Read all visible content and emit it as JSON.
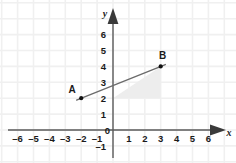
{
  "chart_data": {
    "type": "scatter",
    "title": "",
    "xlabel": "x",
    "ylabel": "y",
    "xlim": [
      -7.1,
      7.3
    ],
    "ylim": [
      -2.0,
      6.6
    ],
    "grid": true,
    "grid_spacing": 1,
    "legend": "none",
    "x_ticks": [
      -6,
      -5,
      -4,
      -3,
      -2,
      -1,
      0,
      1,
      2,
      3,
      4,
      5,
      6
    ],
    "x_tick_labels": [
      "–6",
      "–5",
      "–4",
      "–3",
      "–2",
      "–1",
      "0",
      "1",
      "2",
      "3",
      "4",
      "5",
      "6"
    ],
    "y_ticks": [
      -1,
      0,
      1,
      2,
      3,
      4,
      5,
      6
    ],
    "y_tick_labels": [
      "–1",
      "0",
      "1",
      "2",
      "3",
      "4",
      "5",
      "6"
    ],
    "origin_label": "0",
    "points": [
      {
        "name": "A",
        "label": "A",
        "x": -2,
        "y": 2
      },
      {
        "name": "B",
        "label": "B",
        "x": 3,
        "y": 4
      }
    ],
    "series": [
      {
        "name": "segment-AB",
        "type": "line",
        "from": {
          "x": -2,
          "y": 2
        },
        "to": {
          "x": 3,
          "y": 4
        },
        "color": "#6b6b6b"
      }
    ],
    "shaded_region": {
      "name": "rise-run-triangle",
      "vertices": [
        {
          "x": 0,
          "y": 2
        },
        {
          "x": 3,
          "y": 2
        },
        {
          "x": 3,
          "y": 4
        }
      ],
      "color": "#ededed"
    }
  },
  "colors": {
    "grid": "#f0f0f0",
    "axis": "#5a5a5a",
    "line": "#6b6b6b",
    "point": "#111111",
    "text": "#1a1a1a",
    "shade": "#ededed",
    "background": "#ffffff"
  },
  "axes": {
    "x_axis_name": "x",
    "y_axis_name": "y"
  }
}
